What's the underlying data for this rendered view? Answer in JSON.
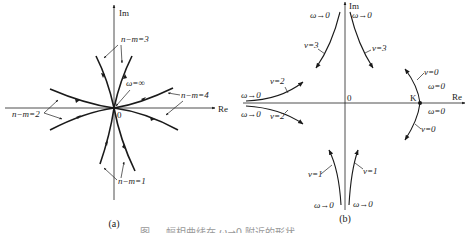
{
  "figure_a": {
    "label": "(a)",
    "axis_real": "Re",
    "axis_imag": "Im",
    "origin": "0",
    "omega_inf": "ω=∞",
    "labels": {
      "nm3": "n−m=3",
      "nm4": "n−m=4",
      "nm2": "n−m=2",
      "nm1": "n−m=1"
    }
  },
  "figure_b": {
    "label": "(b)",
    "axis_real": "Re",
    "axis_imag": "Im",
    "origin": "0",
    "k_point": "K",
    "labels": {
      "w_tl": "ω→0",
      "w_tr": "ω→0",
      "v3_left": "v=3",
      "v3_right": "v=3",
      "w_ml": "ω→0",
      "w_ml2": "ω→0",
      "v2_upper": "v=2",
      "v2_lower": "v=2",
      "v0_upper": "v=0",
      "w0_upper": "ω=0",
      "w0_lower": "ω=0",
      "v0_lower": "v=0",
      "v1_left": "v=1",
      "v1_right": "v=1",
      "w_bl": "ω→0",
      "w_br": "ω→0"
    }
  },
  "caption_partial": "图 ... 幅相曲线在 ω→0 附近的形状"
}
